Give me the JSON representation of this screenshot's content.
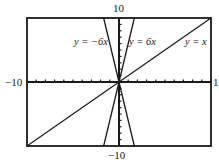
{
  "chart_data": {
    "type": "line",
    "title": "",
    "xlabel": "",
    "ylabel": "",
    "xlim": [
      -10,
      10
    ],
    "ylim": [
      -10,
      10
    ],
    "grid": false,
    "axis_labels": {
      "top": "10",
      "bottom": "−10",
      "left": "−10",
      "right": "1"
    },
    "x_ticks": [
      -10,
      -9,
      -8,
      -7,
      -6,
      -5,
      -4,
      -3,
      -2,
      -1,
      0,
      1,
      2,
      3,
      4,
      5,
      6,
      7,
      8,
      9,
      10
    ],
    "y_ticks": [
      -10,
      -9,
      -8,
      -7,
      -6,
      -5,
      -4,
      -3,
      -2,
      -1,
      0,
      1,
      2,
      3,
      4,
      5,
      6,
      7,
      8,
      9,
      10
    ],
    "series": [
      {
        "name": "y = −6x",
        "slope": -6,
        "intercept": 0,
        "label": "y = −6x",
        "x": [
          -1.667,
          1.667
        ],
        "y": [
          10,
          -10
        ]
      },
      {
        "name": "y = 6x",
        "slope": 6,
        "intercept": 0,
        "label": "y = 6x",
        "x": [
          -1.667,
          1.667
        ],
        "y": [
          -10,
          10
        ]
      },
      {
        "name": "y = x",
        "slope": 1,
        "intercept": 0,
        "label": "y = x",
        "x": [
          -10,
          10
        ],
        "y": [
          -10,
          10
        ]
      }
    ],
    "legend": "inline labels near lines"
  },
  "colors": {
    "line": "#1a1a1a",
    "frame": "#1a1a1a",
    "background": "#ffffff"
  }
}
